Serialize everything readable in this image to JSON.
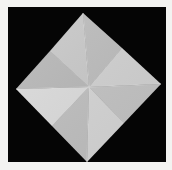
{
  "image": {
    "subject": "folded paper square (origami base) on black background",
    "frame_color": "#f3f3f1",
    "background_color": "#050505",
    "background_rect": {
      "x": 8,
      "y": 7,
      "w": 158,
      "h": 155
    }
  },
  "paper": {
    "vertices": {
      "top": [
        83,
        13
      ],
      "right": [
        161,
        84
      ],
      "bottom": [
        87,
        162
      ],
      "left": [
        16,
        89
      ],
      "center": [
        89,
        87
      ]
    },
    "edge_midpoints": {
      "top_right": [
        122,
        48
      ],
      "right_bottom": [
        124,
        123
      ],
      "bottom_left": [
        52,
        126
      ],
      "left_top": [
        50,
        51
      ]
    },
    "facets": [
      {
        "name": "facet-top-left-upper",
        "points": "83,13 89,87 50,51",
        "fill": "#c9c9c9"
      },
      {
        "name": "facet-top-right-upper",
        "points": "83,13 122,48 89,87",
        "fill": "#bdbdbd"
      },
      {
        "name": "facet-right-upper",
        "points": "122,48 161,84 89,87",
        "fill": "#d2d2d2"
      },
      {
        "name": "facet-right-lower",
        "points": "161,84 124,123 89,87",
        "fill": "#c4c4c4"
      },
      {
        "name": "facet-bottom-right",
        "points": "124,123 87,162 89,87",
        "fill": "#d6d6d6"
      },
      {
        "name": "facet-bottom-left",
        "points": "87,162 52,126 89,87",
        "fill": "#c0c0c0"
      },
      {
        "name": "facet-left-lower",
        "points": "52,126 16,89 89,87",
        "fill": "#dcdcdc"
      },
      {
        "name": "facet-left-upper",
        "points": "16,89 50,51 89,87",
        "fill": "#b8b8b8"
      }
    ],
    "crease_color": "#e6e6e6"
  }
}
